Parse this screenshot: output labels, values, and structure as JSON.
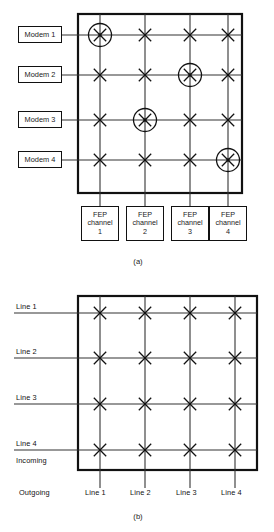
{
  "figure": {
    "caption_a": "(a)",
    "caption_b": "(b)",
    "panel_a": {
      "row_labels": [
        "Modem 1",
        "Modem 2",
        "Modem 3",
        "Modem 4"
      ],
      "column_labels": [
        {
          "line1": "FEP",
          "line2": "channel",
          "line3": "1"
        },
        {
          "line1": "FEP",
          "line2": "channel",
          "line3": "2"
        },
        {
          "line1": "FEP",
          "line2": "channel",
          "line3": "3"
        },
        {
          "line1": "FEP",
          "line2": "channel",
          "line3": "4"
        }
      ],
      "crosspoints": [
        [
          true,
          true,
          true,
          true
        ],
        [
          true,
          true,
          true,
          true
        ],
        [
          true,
          true,
          true,
          true
        ],
        [
          true,
          true,
          true,
          true
        ]
      ],
      "circled_crosspoints": [
        {
          "row": 1,
          "col": 1
        },
        {
          "row": 2,
          "col": 3
        },
        {
          "row": 3,
          "col": 2
        },
        {
          "row": 4,
          "col": 4
        }
      ]
    },
    "panel_b": {
      "row_labels": [
        "Line 1",
        "Line 2",
        "Line 3",
        "Line 4"
      ],
      "incoming_label": "Incoming",
      "outgoing_label": "Outgoing",
      "column_labels": [
        "Line 1",
        "Line 2",
        "Line 3",
        "Line 4"
      ],
      "circled_crosspoints": []
    }
  },
  "colors": {
    "ink": "#111111",
    "paper": "#ffffff",
    "grid": "#222222"
  }
}
